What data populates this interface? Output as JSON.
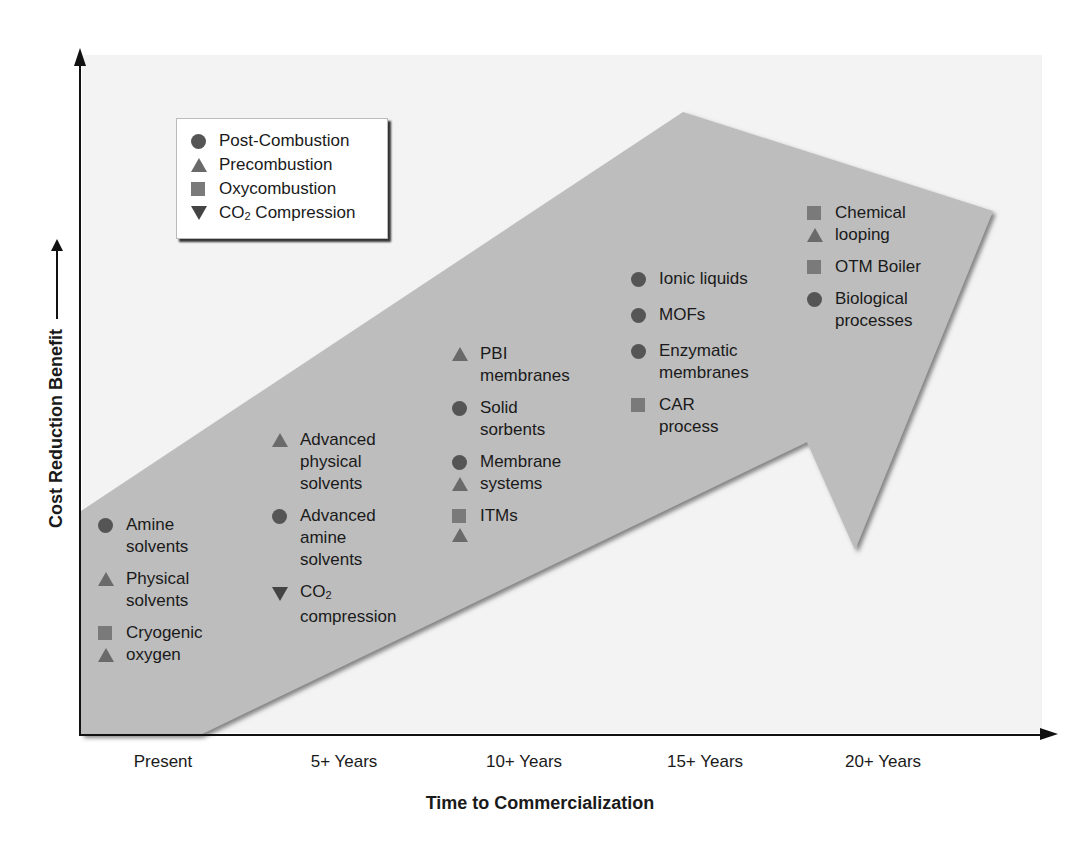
{
  "colors": {
    "arrow_fill": "#bdbdbd",
    "plot_bg": "#f3f3f3",
    "post_combustion": "#555555",
    "precombustion": "#6a6a6a",
    "oxycombustion": "#7a7a7a",
    "co2_compression": "#444444"
  },
  "axes": {
    "x_title": "Time to Commercialization",
    "y_title": "Cost Reduction Benefit",
    "x_ticks": [
      "Present",
      "5+ Years",
      "10+ Years",
      "15+ Years",
      "20+ Years"
    ]
  },
  "legend": {
    "items": [
      {
        "marker": "circle",
        "label": "Post-Combustion"
      },
      {
        "marker": "triangle-up",
        "label": "Precombustion"
      },
      {
        "marker": "square",
        "label": "Oxycombustion"
      },
      {
        "marker": "triangle-down",
        "label_main": "CO",
        "label_sub": "2",
        "label_rest": " Compression"
      }
    ]
  },
  "columns": [
    {
      "period": "Present",
      "technologies": [
        {
          "markers": [
            "circle"
          ],
          "lines": [
            "Amine",
            "solvents"
          ]
        },
        {
          "markers": [
            "triangle-up"
          ],
          "lines": [
            "Physical",
            "solvents"
          ]
        },
        {
          "markers": [
            "square",
            "triangle-up"
          ],
          "lines": [
            "Cryogenic",
            "oxygen"
          ]
        }
      ]
    },
    {
      "period": "5+ Years",
      "technologies": [
        {
          "markers": [
            "triangle-up"
          ],
          "lines": [
            "Advanced",
            "physical",
            "solvents"
          ]
        },
        {
          "markers": [
            "circle"
          ],
          "lines": [
            "Advanced",
            "amine",
            "solvents"
          ]
        },
        {
          "markers": [
            "triangle-down"
          ],
          "lines": [
            "CO2",
            "compression"
          ]
        }
      ]
    },
    {
      "period": "10+ Years",
      "technologies": [
        {
          "markers": [
            "triangle-up"
          ],
          "lines": [
            "PBI",
            "membranes"
          ]
        },
        {
          "markers": [
            "circle"
          ],
          "lines": [
            "Solid",
            "sorbents"
          ]
        },
        {
          "markers": [
            "circle",
            "triangle-up"
          ],
          "lines": [
            "Membrane",
            "systems"
          ]
        },
        {
          "markers": [
            "square",
            "triangle-up"
          ],
          "lines": [
            "ITMs",
            ""
          ]
        }
      ]
    },
    {
      "period": "15+ Years",
      "technologies": [
        {
          "markers": [
            "circle"
          ],
          "lines": [
            "Ionic liquids"
          ]
        },
        {
          "markers": [
            "circle"
          ],
          "lines": [
            "MOFs"
          ]
        },
        {
          "markers": [
            "circle"
          ],
          "lines": [
            "Enzymatic",
            "membranes"
          ]
        },
        {
          "markers": [
            "square"
          ],
          "lines": [
            "CAR",
            "process"
          ]
        }
      ]
    },
    {
      "period": "20+ Years",
      "technologies": [
        {
          "markers": [
            "square",
            "triangle-up"
          ],
          "lines": [
            "Chemical",
            "looping"
          ]
        },
        {
          "markers": [
            "square"
          ],
          "lines": [
            "OTM Boiler"
          ]
        },
        {
          "markers": [
            "circle"
          ],
          "lines": [
            "Biological",
            "processes"
          ]
        }
      ]
    }
  ]
}
